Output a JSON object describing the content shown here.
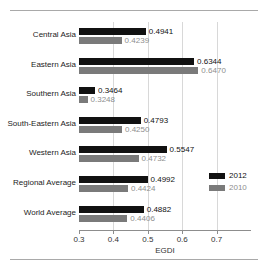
{
  "chart_data": {
    "type": "bar",
    "orientation": "horizontal",
    "title": "",
    "xlabel": "EGDI",
    "ylabel": "",
    "xlim": [
      0.3,
      0.8
    ],
    "xticks": [
      0.3,
      0.4,
      0.5,
      0.6,
      0.7
    ],
    "xtick_labels": [
      "0.3",
      "0.4",
      "0.5",
      "0.6",
      "0.7"
    ],
    "grid": true,
    "legend_position": "right",
    "categories": [
      "Central Asia",
      "Eastern Asia",
      "Southern Asia",
      "South-Eastern Asia",
      "Western Asia",
      "Regional Average",
      "World Average"
    ],
    "series": [
      {
        "name": "2012",
        "color": "#111111",
        "values": [
          0.4941,
          0.6344,
          0.3464,
          0.4793,
          0.5547,
          0.4992,
          0.4882
        ],
        "labels": [
          "0.4941",
          "0.6344",
          "0.3464",
          "0.4793",
          "0.5547",
          "0.4992",
          "0.4882"
        ]
      },
      {
        "name": "2010",
        "color": "#7a7a7a",
        "values": [
          0.4239,
          0.647,
          0.3248,
          0.425,
          0.4732,
          0.4424,
          0.4406
        ],
        "labels": [
          "0.4239",
          "0.6470",
          "0.3248",
          "0.4250",
          "0.4732",
          "0.4424",
          "0.4406"
        ]
      }
    ]
  },
  "legend": {
    "items": [
      {
        "label": "2012",
        "color": "#111111"
      },
      {
        "label": "2010",
        "color": "#7a7a7a"
      }
    ]
  }
}
